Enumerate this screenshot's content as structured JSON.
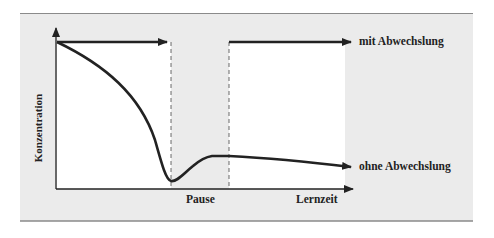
{
  "diagram": {
    "y_axis_label": "Konzentration",
    "x_axis_label": "Lernzeit",
    "pause_label": "Pause",
    "series": [
      {
        "name": "mit Abwechslung",
        "description": "concentration stays at maximum level before and after the pause"
      },
      {
        "name": "ohne Abwechslung",
        "description": "concentration drops steeply to a minimum at the start of the pause, recovers partially during the pause, then slowly declines"
      }
    ],
    "colors": {
      "panel_background": "#ebebeb",
      "plot_background": "#ffffff",
      "lines": "#222222",
      "rule": "#8a8a8a"
    }
  }
}
